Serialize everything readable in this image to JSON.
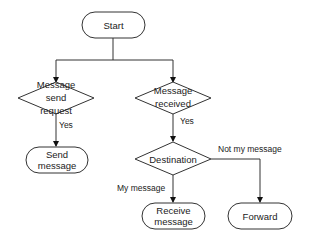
{
  "diagram": {
    "type": "flowchart",
    "nodes": {
      "start": {
        "shape": "terminal",
        "lines": [
          "Start"
        ]
      },
      "send_request": {
        "shape": "decision",
        "lines": [
          "Message",
          "send",
          "request"
        ]
      },
      "message_received": {
        "shape": "decision",
        "lines": [
          "Message",
          "received"
        ]
      },
      "send_message": {
        "shape": "terminal",
        "lines": [
          "Send",
          "message"
        ]
      },
      "destination": {
        "shape": "decision",
        "lines": [
          "Destination"
        ]
      },
      "receive_message": {
        "shape": "terminal",
        "lines": [
          "Receive",
          "message"
        ]
      },
      "forward": {
        "shape": "terminal",
        "lines": [
          "Forward"
        ]
      }
    },
    "edges": [
      {
        "from": "start",
        "to": "send_request",
        "label": ""
      },
      {
        "from": "start",
        "to": "message_received",
        "label": ""
      },
      {
        "from": "send_request",
        "to": "send_message",
        "label": "Yes"
      },
      {
        "from": "message_received",
        "to": "destination",
        "label": "Yes"
      },
      {
        "from": "destination",
        "to": "receive_message",
        "label": "My message"
      },
      {
        "from": "destination",
        "to": "forward",
        "label": "Not my message"
      }
    ],
    "labels": {
      "yes_left": "Yes",
      "yes_right": "Yes",
      "my_message": "My message",
      "not_my_message": "Not my message"
    },
    "colors": {
      "stroke": "#333333",
      "fill": "#ffffff",
      "text": "#222222"
    }
  }
}
